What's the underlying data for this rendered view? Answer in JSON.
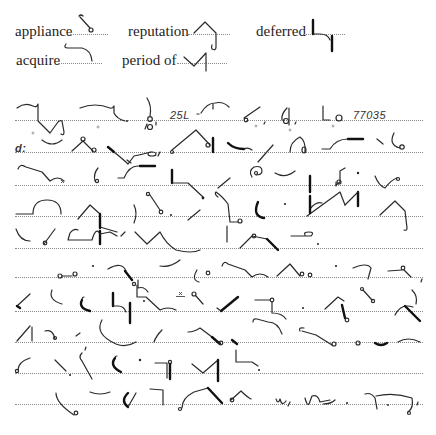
{
  "document": {
    "type": "shorthand-exercise",
    "vocabulary": [
      {
        "word": "appliance",
        "row": 1
      },
      {
        "word": "reputation",
        "row": 1
      },
      {
        "word": "deferred",
        "row": 1
      },
      {
        "word": "acquire",
        "row": 2
      },
      {
        "word": "period of",
        "row": 2
      }
    ],
    "passage": {
      "line_count": 10,
      "inline_text": {
        "line1_number": "25L",
        "line1_code": "77035",
        "line2_prefix": "d:"
      }
    },
    "colors": {
      "ink": "#2a2a2a",
      "ruling": "#8a8a8a",
      "background": "#ffffff"
    }
  }
}
